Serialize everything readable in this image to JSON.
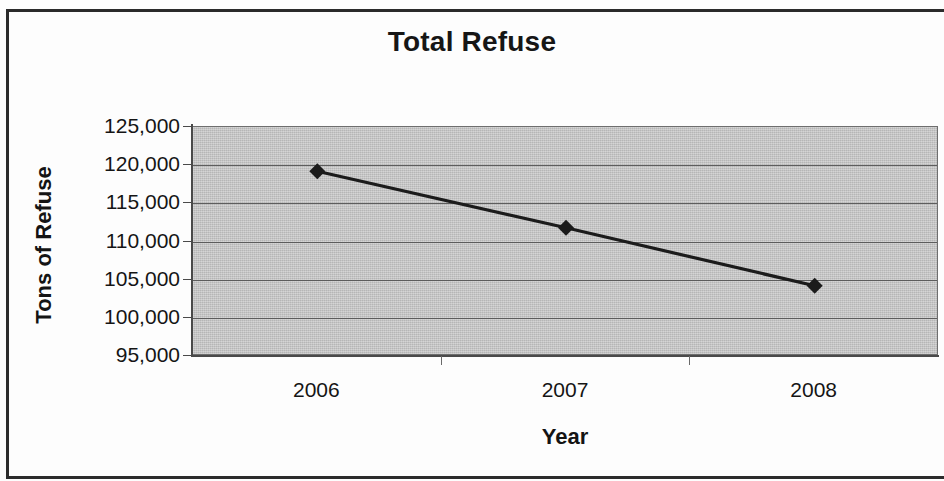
{
  "chart_data": {
    "type": "line",
    "title": "Total Refuse",
    "xlabel": "Year",
    "ylabel": "Tons of Refuse",
    "categories": [
      "2006",
      "2007",
      "2008"
    ],
    "values": [
      119200,
      111800,
      104200
    ],
    "series": [
      {
        "name": "Total Refuse",
        "values": [
          119200,
          111800,
          104200
        ],
        "marker": "diamond",
        "marker_color": "#1b1b1b",
        "line_color": "#1b1b1b"
      }
    ],
    "ylim": [
      95000,
      125000
    ],
    "ytick_values": [
      125000,
      120000,
      115000,
      110000,
      105000,
      100000,
      95000
    ],
    "ytick_labels": [
      "125,000",
      "120,000",
      "115,000",
      "110,000",
      "105,000",
      "100,000",
      "95,000"
    ],
    "xtick_labels": [
      "2006",
      "2007",
      "2008"
    ],
    "grid": true,
    "grid_axis": "y",
    "legend": false,
    "legend_position": "none",
    "plot_background": "#c8c8c8",
    "figure_background": "#ffffff",
    "axis_color": "#4a4a4a",
    "gridline_color": "#5d5d5d"
  },
  "figure": {
    "border_color": "#2b2b2b"
  }
}
